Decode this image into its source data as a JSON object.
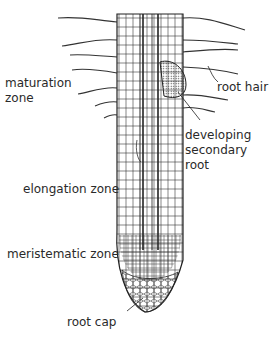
{
  "labels": {
    "maturation_zone_line1": "maturation",
    "maturation_zone_line2": "zone",
    "root_hair": "root hair",
    "developing_line1": "developing",
    "developing_line2": "secondary",
    "developing_line3": "root",
    "elongation_zone": "elongation zone",
    "meristematic_zone": "meristematic zone",
    "root_cap": "root cap"
  },
  "colors": {
    "ink": "#2a2a2a",
    "background": "#ffffff"
  }
}
